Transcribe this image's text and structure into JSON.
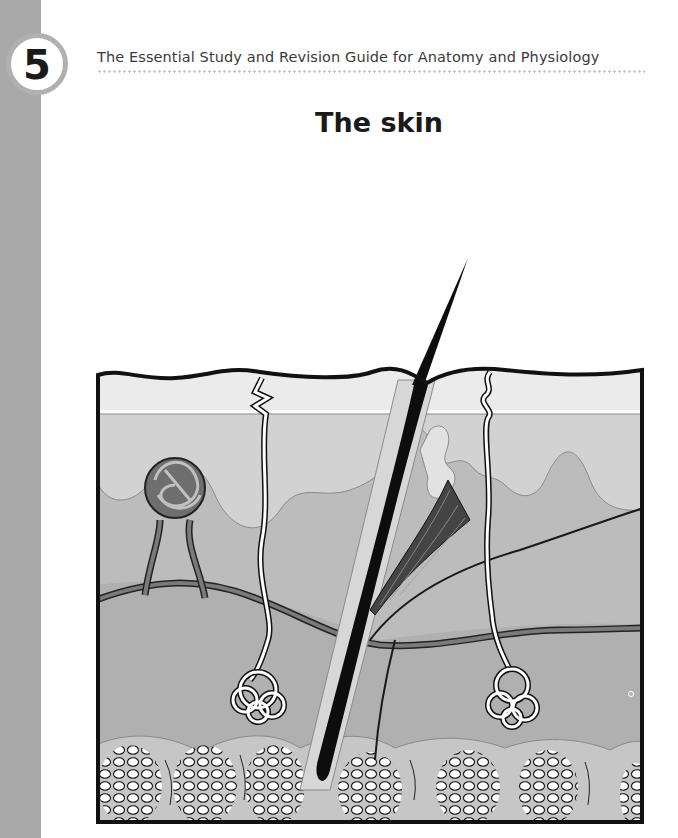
{
  "page": {
    "chapter_number": "5",
    "running_head": "The Essential Study and Revision Guide for Anatomy and Physiology",
    "title": "The skin"
  },
  "figure": {
    "labels_shown": false,
    "structures": [
      "epidermis",
      "dermal-papillae",
      "dermis",
      "hypodermis-adipose-tissue",
      "hair-shaft",
      "hair-follicle",
      "arrector-pili-muscle",
      "sebaceous-gland",
      "sweat-gland-duct",
      "sweat-gland-coil",
      "blood-vessels",
      "nerve-fibres",
      "capillary-loop"
    ],
    "colors": {
      "sidebar": "#a8a8a8",
      "badge_ring": "#b0b0b0",
      "epidermis_top": "#eeeeee",
      "papillae": "#c9c9c9",
      "dermis": "#b4b4b4",
      "hypodermis": "#a9a9a9",
      "outline": "#111111",
      "vessel": "#7a7a7a"
    }
  }
}
